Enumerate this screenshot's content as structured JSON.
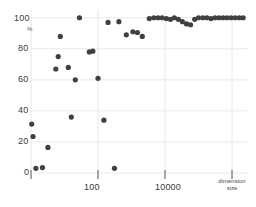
{
  "chart_data": {
    "type": "scatter",
    "title": "",
    "subtitle": "",
    "xlabel": "dimension size",
    "ylabel": "%",
    "xscale": "log",
    "yscale": "linear",
    "xlim": [
      1,
      3000000
    ],
    "ylim": [
      0,
      105
    ],
    "grid": true,
    "legend": null,
    "legend_position": "none",
    "marker_color": "#404040",
    "marker_size": 2.6,
    "background_color": "#ffffff",
    "grid_color": "#e8e8e8",
    "axis_text_color": "#3a3a3a",
    "y_ticks": [
      0,
      20,
      40,
      60,
      80,
      100
    ],
    "y_tick_labels": [
      "0",
      "20",
      "40",
      "60",
      "80",
      "100"
    ],
    "x_ticks": [
      1,
      100,
      10000,
      1000000
    ],
    "x_tick_labels": [
      "",
      "100",
      "10000",
      ""
    ],
    "series": [
      {
        "name": "coverage",
        "points": [
          [
            1.4,
            3.0
          ],
          [
            2.2,
            3.5
          ],
          [
            1.15,
            23.5
          ],
          [
            1.05,
            31.5
          ],
          [
            3.2,
            16.5
          ],
          [
            5.5,
            67.0
          ],
          [
            6.5,
            75.0
          ],
          [
            7.5,
            88.0
          ],
          [
            13.0,
            68.0
          ],
          [
            16.0,
            36.0
          ],
          [
            21.0,
            60.0
          ],
          [
            28.0,
            100.0
          ],
          [
            55.0,
            78.0
          ],
          [
            70.0,
            78.5
          ],
          [
            100.0,
            61.0
          ],
          [
            150.0,
            34.0
          ],
          [
            200.0,
            97.0
          ],
          [
            310.0,
            3.0
          ],
          [
            420.0,
            97.5
          ],
          [
            700.0,
            89.0
          ],
          [
            1100.0,
            91.0
          ],
          [
            1500.0,
            90.5
          ],
          [
            2100.0,
            88.0
          ],
          [
            3400.0,
            99.5
          ],
          [
            4600.0,
            100.0
          ],
          [
            6200.0,
            100.0
          ],
          [
            8200.0,
            100.0
          ],
          [
            11000.0,
            99.5
          ],
          [
            14500.0,
            99.0
          ],
          [
            19000.0,
            100.0
          ],
          [
            25000.0,
            99.0
          ],
          [
            33000.0,
            97.5
          ],
          [
            44000.0,
            96.0
          ],
          [
            58000.0,
            95.5
          ],
          [
            77000.0,
            99.0
          ],
          [
            100000.0,
            100.0
          ],
          [
            135000.0,
            100.0
          ],
          [
            178000.0,
            100.0
          ],
          [
            235000.0,
            99.5
          ],
          [
            310000.0,
            100.0
          ],
          [
            410000.0,
            100.0
          ],
          [
            540000.0,
            100.0
          ],
          [
            710000.0,
            100.0
          ],
          [
            940000.0,
            100.0
          ],
          [
            1250000.0,
            100.0
          ],
          [
            1650000.0,
            100.0
          ],
          [
            2150000.0,
            100.0
          ]
        ]
      }
    ]
  },
  "axes": {
    "y_axis_unit": "%",
    "x_axis_title_line1": "dimension",
    "x_axis_title_line2": "size"
  }
}
